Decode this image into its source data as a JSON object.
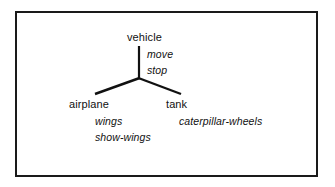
{
  "figure": {
    "kind": "class-hierarchy-diagram",
    "border_color": "#1a1a1a",
    "background_color": "#ffffff",
    "line_color": "#111111",
    "text_color": "#111111"
  },
  "tree": {
    "root": {
      "name": "vehicle",
      "members": [
        {
          "label": "move"
        },
        {
          "label": "stop"
        }
      ]
    },
    "children": [
      {
        "name": "airplane",
        "members": [
          {
            "label": "wings"
          },
          {
            "label": "show-wings"
          }
        ]
      },
      {
        "name": "tank",
        "members": [
          {
            "label": "caterpillar-wheels"
          }
        ]
      }
    ]
  },
  "edges": {
    "trunk": {
      "x1": 139,
      "y1": 46,
      "x2": 139,
      "y2": 78
    },
    "left_branch": {
      "x1": 139,
      "y1": 78,
      "x2": 95,
      "y2": 94
    },
    "right_branch": {
      "x1": 139,
      "y1": 78,
      "x2": 181,
      "y2": 94
    }
  }
}
